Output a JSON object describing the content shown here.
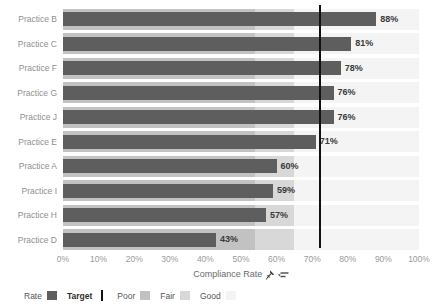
{
  "chart_data": {
    "type": "bar",
    "orientation": "horizontal",
    "categories": [
      "Practice B",
      "Practice C",
      "Practice F",
      "Practice G",
      "Practice J",
      "Practice E",
      "Practice A",
      "Practice I",
      "Practice H",
      "Practice D"
    ],
    "values": [
      88,
      81,
      78,
      76,
      76,
      71,
      60,
      59,
      57,
      43
    ],
    "value_labels": [
      "88%",
      "81%",
      "78%",
      "76%",
      "76%",
      "71%",
      "60%",
      "59%",
      "57%",
      "43%"
    ],
    "xlabel": "Compliance Rate",
    "x_ticks": [
      "0%",
      "10%",
      "20%",
      "30%",
      "40%",
      "50%",
      "60%",
      "70%",
      "80%",
      "90%",
      "100%"
    ],
    "xlim": [
      0,
      100
    ],
    "grid": false,
    "target_value": 72,
    "target_line_color": "#111111",
    "bar_color": "#5e5e5e",
    "bands": [
      {
        "label": "Poor",
        "from": 0,
        "to": 54,
        "color": "#c2c2c2"
      },
      {
        "label": "Fair",
        "from": 54,
        "to": 65,
        "color": "#d8d8d8"
      },
      {
        "label": "Good",
        "from": 65,
        "to": 100,
        "color": "#f4f4f4"
      }
    ],
    "legend": {
      "rate_label": "Rate",
      "target_label": "Target"
    },
    "axis_icons": [
      "pin-icon",
      "sort-icon"
    ]
  }
}
